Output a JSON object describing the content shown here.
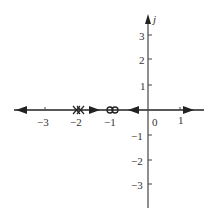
{
  "diagram": {
    "type": "root-locus / pole-zero plot",
    "imag_axis_label": "j",
    "real_ticks": [
      {
        "value": -3,
        "label": "−3"
      },
      {
        "value": -2,
        "label": "−2"
      },
      {
        "value": -1,
        "label": "−1"
      },
      {
        "value": 0,
        "label": "0"
      },
      {
        "value": 1,
        "label": "1"
      }
    ],
    "imag_ticks": [
      {
        "value": 3,
        "label": "3"
      },
      {
        "value": 2,
        "label": "2"
      },
      {
        "value": 1,
        "label": "1"
      },
      {
        "value": -1,
        "label": "−1"
      },
      {
        "value": -2,
        "label": "−2"
      },
      {
        "value": -3,
        "label": "−3"
      }
    ],
    "poles": [
      {
        "re": -2,
        "im": 0,
        "multiplicity": 2,
        "marker": "x"
      }
    ],
    "zeros": [
      {
        "re": -1,
        "im": 0,
        "multiplicity": 2,
        "marker": "o"
      }
    ],
    "locus_arrows": [
      {
        "at": -3.8,
        "direction": "left"
      },
      {
        "at": -1.6,
        "direction": "right"
      },
      {
        "at": -0.45,
        "direction": "left"
      },
      {
        "at": 1.3,
        "direction": "right"
      }
    ],
    "line_color": "#222222"
  }
}
